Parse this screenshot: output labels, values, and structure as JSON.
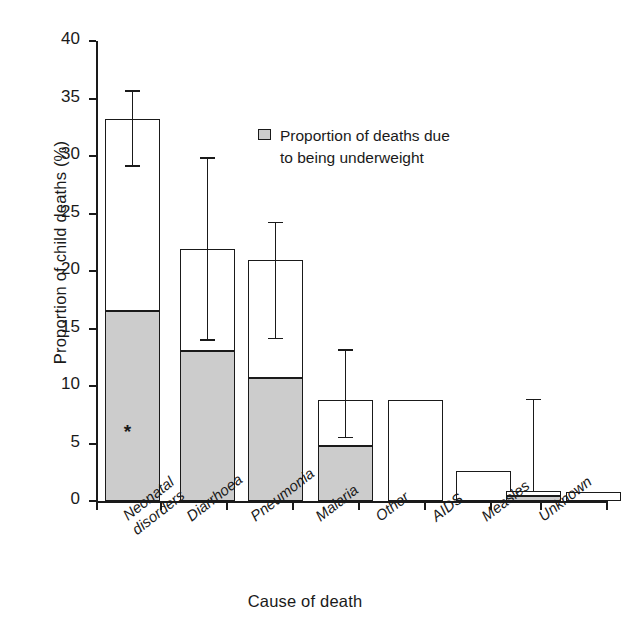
{
  "chart_data": {
    "type": "bar",
    "title": "",
    "xlabel": "Cause of death",
    "ylabel": "Proportion of child deaths (%)",
    "ylim": [
      0,
      40
    ],
    "yticks": [
      0,
      5,
      10,
      15,
      20,
      25,
      30,
      35,
      40
    ],
    "grid": false,
    "legend_position": "inside-top-right",
    "legend": [
      "Proportion of deaths due to being underweight"
    ],
    "categories": [
      "Neonatal disorders",
      "Diarrhoea",
      "Pneumonia",
      "Malaria",
      "Other",
      "AIDS",
      "Measles",
      "Unknown"
    ],
    "series": [
      {
        "name": "Total proportion of child deaths",
        "values": [
          33.2,
          21.9,
          21.0,
          8.8,
          8.8,
          2.6,
          0.9,
          0.8
        ]
      },
      {
        "name": "Proportion of deaths due to being underweight",
        "values": [
          16.6,
          13.1,
          10.8,
          4.9,
          0,
          0,
          0.5,
          0
        ]
      }
    ],
    "error_bars": [
      {
        "category": "Neonatal disorders",
        "low": 29.2,
        "high": 35.7
      },
      {
        "category": "Diarrhoea",
        "low": 14.1,
        "high": 29.9
      },
      {
        "category": "Pneumonia",
        "low": 14.2,
        "high": 24.3
      },
      {
        "category": "Malaria",
        "low": 5.6,
        "high": 13.2
      },
      {
        "category": "Measles",
        "low": 0.9,
        "high": 8.9
      }
    ],
    "annotations": [
      {
        "symbol": "*",
        "category": "Neonatal disorders",
        "value": 6.1
      }
    ]
  },
  "legend": {
    "swatch_name": "underweight-proportion-swatch",
    "line1": "Proportion of deaths due",
    "line2": "to being underweight"
  },
  "axes": {
    "y_label": "Proportion of child deaths (%)",
    "x_label": "Cause of death",
    "y_tick_labels": [
      "40",
      "35",
      "30",
      "25",
      "20",
      "15",
      "10",
      "5",
      "0"
    ],
    "x_tick_labels": [
      [
        "Neonatal",
        "disorders"
      ],
      [
        "Diarrhoea"
      ],
      [
        "Pneumonia"
      ],
      [
        "Malaria"
      ],
      [
        "Other"
      ],
      [
        "AIDS"
      ],
      [
        "Measles"
      ],
      [
        "Unknown"
      ]
    ]
  },
  "colors": {
    "ink": "#1a1a1a",
    "fill_gray": "#cccccc",
    "background": "#ffffff"
  }
}
